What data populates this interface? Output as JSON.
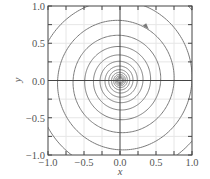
{
  "chart_data": {
    "type": "line",
    "title": "",
    "xlabel": "x",
    "ylabel": "y",
    "xlim": [
      -1.0,
      1.0
    ],
    "ylim": [
      -1.0,
      1.0
    ],
    "grid": true,
    "legend": null,
    "xticks": [
      "−1.0",
      "−0.5",
      "0.0",
      "0.5",
      "1.0"
    ],
    "yticks": [
      "−1.0",
      "−0.5",
      "0.0",
      "0.5",
      "1.0"
    ],
    "xtick_values": [
      -1.0,
      -0.5,
      0.0,
      0.5,
      1.0
    ],
    "ytick_values": [
      -1.0,
      -0.5,
      0.0,
      0.5,
      1.0
    ],
    "series": [
      {
        "name": "trajectory (stable spiral to origin)",
        "kind": "logarithmic spiral",
        "center": [
          0.0,
          0.0
        ],
        "r_start": 1.45,
        "growth_per_turn": 1.33,
        "turns": 14,
        "direction": "clockwise inward",
        "arrow_at": [
          0.35,
          0.72
        ]
      }
    ],
    "annotations": [
      {
        "type": "arrowhead",
        "x": 0.35,
        "y": 0.72,
        "direction": "clockwise"
      }
    ]
  },
  "colors": {
    "curve": "#7a7a7a",
    "axes": "#444444",
    "grid": "#e6e6e6",
    "text": "#555555"
  }
}
